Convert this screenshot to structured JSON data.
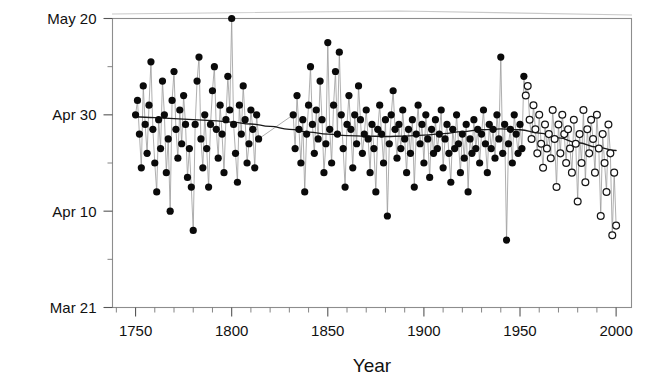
{
  "chart_data": {
    "type": "scatter",
    "title": "",
    "subtitle": "",
    "xlabel": "Year",
    "ylabel": "",
    "xlim": [
      1738,
      2008
    ],
    "ylim_dayofyear": [
      80,
      140
    ],
    "grid": false,
    "legend_position": "none",
    "annotations": [],
    "x_ticks_major": [
      1750,
      1800,
      1850,
      1900,
      1950,
      2000
    ],
    "x_tick_labels": [
      "1750",
      "1800",
      "1850",
      "1900",
      "1950",
      "2000"
    ],
    "x_ticks_minor_step": 10,
    "y_ticks_major_labels": [
      "May 20",
      "Apr 30",
      "Apr 10",
      "Mar 21"
    ],
    "y_ticks_major_dayofyear": [
      140,
      120,
      100,
      80
    ],
    "y_ticks_minor_dayofyear": [
      130,
      110,
      90
    ],
    "colors": {
      "point_filled": "#0a0a0a",
      "point_open_fill": "#ffffff",
      "point_open_stroke": "#151515",
      "connector": "#9a9a9a",
      "trend": "#1a1a1a",
      "frame": "#8d8d8d",
      "text": "#111111"
    },
    "marker_legend": {
      "filled_circle": "historical record",
      "open_circle": "recent record"
    },
    "data_gap_years": [
      1815,
      1831
    ],
    "open_marker_start_year": 1953,
    "series": [
      {
        "name": "Flowering date",
        "marker": "circle",
        "points": [
          [
            1750,
            120
          ],
          [
            1751,
            123
          ],
          [
            1752,
            116
          ],
          [
            1753,
            109
          ],
          [
            1754,
            126
          ],
          [
            1755,
            118
          ],
          [
            1756,
            112
          ],
          [
            1757,
            122
          ],
          [
            1758,
            131
          ],
          [
            1759,
            117
          ],
          [
            1760,
            110
          ],
          [
            1761,
            104
          ],
          [
            1762,
            119
          ],
          [
            1763,
            113
          ],
          [
            1764,
            127
          ],
          [
            1765,
            120
          ],
          [
            1766,
            108
          ],
          [
            1767,
            115
          ],
          [
            1768,
            100
          ],
          [
            1769,
            123
          ],
          [
            1770,
            129
          ],
          [
            1771,
            117
          ],
          [
            1772,
            111
          ],
          [
            1773,
            121
          ],
          [
            1774,
            114
          ],
          [
            1775,
            124
          ],
          [
            1776,
            118
          ],
          [
            1777,
            107
          ],
          [
            1778,
            113
          ],
          [
            1779,
            105
          ],
          [
            1780,
            96
          ],
          [
            1781,
            118
          ],
          [
            1782,
            127
          ],
          [
            1783,
            132
          ],
          [
            1784,
            115
          ],
          [
            1785,
            109
          ],
          [
            1786,
            120
          ],
          [
            1787,
            113
          ],
          [
            1788,
            105
          ],
          [
            1789,
            118
          ],
          [
            1790,
            125
          ],
          [
            1791,
            130
          ],
          [
            1792,
            117
          ],
          [
            1793,
            111
          ],
          [
            1794,
            122
          ],
          [
            1795,
            116
          ],
          [
            1796,
            108
          ],
          [
            1797,
            119
          ],
          [
            1798,
            128
          ],
          [
            1799,
            121
          ],
          [
            1800,
            140
          ],
          [
            1801,
            118
          ],
          [
            1802,
            112
          ],
          [
            1803,
            106
          ],
          [
            1804,
            122
          ],
          [
            1805,
            116
          ],
          [
            1806,
            126
          ],
          [
            1807,
            119
          ],
          [
            1808,
            110
          ],
          [
            1809,
            114
          ],
          [
            1810,
            121
          ],
          [
            1811,
            117
          ],
          [
            1812,
            109
          ],
          [
            1813,
            120
          ],
          [
            1814,
            115
          ],
          [
            1832,
            120
          ],
          [
            1833,
            113
          ],
          [
            1834,
            124
          ],
          [
            1835,
            117
          ],
          [
            1836,
            110
          ],
          [
            1837,
            119
          ],
          [
            1838,
            104
          ],
          [
            1839,
            116
          ],
          [
            1840,
            122
          ],
          [
            1841,
            130
          ],
          [
            1842,
            118
          ],
          [
            1843,
            112
          ],
          [
            1844,
            121
          ],
          [
            1845,
            115
          ],
          [
            1846,
            127
          ],
          [
            1847,
            119
          ],
          [
            1848,
            108
          ],
          [
            1849,
            114
          ],
          [
            1850,
            135
          ],
          [
            1851,
            117
          ],
          [
            1852,
            110
          ],
          [
            1853,
            122
          ],
          [
            1854,
            129
          ],
          [
            1855,
            116
          ],
          [
            1856,
            133
          ],
          [
            1857,
            120
          ],
          [
            1858,
            113
          ],
          [
            1859,
            105
          ],
          [
            1860,
            118
          ],
          [
            1861,
            124
          ],
          [
            1862,
            117
          ],
          [
            1863,
            109
          ],
          [
            1864,
            120
          ],
          [
            1865,
            114
          ],
          [
            1866,
            126
          ],
          [
            1867,
            119
          ],
          [
            1868,
            112
          ],
          [
            1869,
            116
          ],
          [
            1870,
            121
          ],
          [
            1871,
            115
          ],
          [
            1872,
            108
          ],
          [
            1873,
            118
          ],
          [
            1874,
            113
          ],
          [
            1875,
            104
          ],
          [
            1876,
            117
          ],
          [
            1877,
            122
          ],
          [
            1878,
            116
          ],
          [
            1879,
            110
          ],
          [
            1880,
            119
          ],
          [
            1881,
            99
          ],
          [
            1882,
            114
          ],
          [
            1883,
            120
          ],
          [
            1884,
            125
          ],
          [
            1885,
            117
          ],
          [
            1886,
            111
          ],
          [
            1887,
            118
          ],
          [
            1888,
            113
          ],
          [
            1889,
            121
          ],
          [
            1890,
            115
          ],
          [
            1891,
            108
          ],
          [
            1892,
            117
          ],
          [
            1893,
            112
          ],
          [
            1894,
            119
          ],
          [
            1895,
            105
          ],
          [
            1896,
            116
          ],
          [
            1897,
            122
          ],
          [
            1898,
            114
          ],
          [
            1899,
            118
          ],
          [
            1900,
            110
          ],
          [
            1901,
            120
          ],
          [
            1902,
            115
          ],
          [
            1903,
            107
          ],
          [
            1904,
            117
          ],
          [
            1905,
            112
          ],
          [
            1906,
            119
          ],
          [
            1907,
            113
          ],
          [
            1908,
            116
          ],
          [
            1909,
            121
          ],
          [
            1910,
            109
          ],
          [
            1911,
            115
          ],
          [
            1912,
            118
          ],
          [
            1913,
            112
          ],
          [
            1914,
            106
          ],
          [
            1915,
            117
          ],
          [
            1916,
            113
          ],
          [
            1917,
            120
          ],
          [
            1918,
            114
          ],
          [
            1919,
            108
          ],
          [
            1920,
            116
          ],
          [
            1921,
            111
          ],
          [
            1922,
            118
          ],
          [
            1923,
            104
          ],
          [
            1924,
            115
          ],
          [
            1925,
            112
          ],
          [
            1926,
            119
          ],
          [
            1927,
            113
          ],
          [
            1928,
            117
          ],
          [
            1929,
            110
          ],
          [
            1930,
            116
          ],
          [
            1931,
            121
          ],
          [
            1932,
            114
          ],
          [
            1933,
            108
          ],
          [
            1934,
            118
          ],
          [
            1935,
            113
          ],
          [
            1936,
            117
          ],
          [
            1937,
            111
          ],
          [
            1938,
            120
          ],
          [
            1939,
            115
          ],
          [
            1940,
            132
          ],
          [
            1941,
            112
          ],
          [
            1942,
            118
          ],
          [
            1943,
            94
          ],
          [
            1944,
            114
          ],
          [
            1945,
            117
          ],
          [
            1946,
            110
          ],
          [
            1947,
            120
          ],
          [
            1948,
            116
          ],
          [
            1949,
            112
          ],
          [
            1950,
            118
          ],
          [
            1951,
            113
          ],
          [
            1952,
            128
          ],
          [
            1953,
            124
          ],
          [
            1954,
            126
          ],
          [
            1955,
            119
          ],
          [
            1956,
            115
          ],
          [
            1957,
            122
          ],
          [
            1958,
            117
          ],
          [
            1959,
            112
          ],
          [
            1960,
            120
          ],
          [
            1961,
            114
          ],
          [
            1962,
            109
          ],
          [
            1963,
            118
          ],
          [
            1964,
            113
          ],
          [
            1965,
            116
          ],
          [
            1966,
            111
          ],
          [
            1967,
            121
          ],
          [
            1968,
            115
          ],
          [
            1969,
            105
          ],
          [
            1970,
            118
          ],
          [
            1971,
            112
          ],
          [
            1972,
            120
          ],
          [
            1973,
            116
          ],
          [
            1974,
            110
          ],
          [
            1975,
            117
          ],
          [
            1976,
            113
          ],
          [
            1977,
            108
          ],
          [
            1978,
            119
          ],
          [
            1979,
            114
          ],
          [
            1980,
            102
          ],
          [
            1981,
            116
          ],
          [
            1982,
            110
          ],
          [
            1983,
            121
          ],
          [
            1984,
            106
          ],
          [
            1985,
            117
          ],
          [
            1986,
            112
          ],
          [
            1987,
            119
          ],
          [
            1988,
            115
          ],
          [
            1989,
            108
          ],
          [
            1990,
            120
          ],
          [
            1991,
            113
          ],
          [
            1992,
            99
          ],
          [
            1993,
            116
          ],
          [
            1994,
            110
          ],
          [
            1995,
            104
          ],
          [
            1996,
            118
          ],
          [
            1997,
            112
          ],
          [
            1998,
            95
          ],
          [
            1999,
            108
          ],
          [
            2000,
            97
          ]
        ]
      }
    ],
    "trend": {
      "name": "Smoothed trend",
      "points": [
        [
          1750,
          119.6
        ],
        [
          1760,
          119.4
        ],
        [
          1770,
          119.2
        ],
        [
          1780,
          119.0
        ],
        [
          1790,
          118.8
        ],
        [
          1800,
          118.5
        ],
        [
          1810,
          118.1
        ],
        [
          1820,
          117.6
        ],
        [
          1830,
          117.0
        ],
        [
          1840,
          116.4
        ],
        [
          1850,
          116.0
        ],
        [
          1860,
          115.7
        ],
        [
          1870,
          115.6
        ],
        [
          1880,
          115.5
        ],
        [
          1890,
          115.6
        ],
        [
          1900,
          115.8
        ],
        [
          1910,
          116.1
        ],
        [
          1920,
          116.5
        ],
        [
          1930,
          116.9
        ],
        [
          1940,
          117.1
        ],
        [
          1950,
          116.9
        ],
        [
          1960,
          116.2
        ],
        [
          1970,
          115.2
        ],
        [
          1980,
          114.2
        ],
        [
          1990,
          113.3
        ],
        [
          2000,
          112.6
        ]
      ]
    }
  }
}
